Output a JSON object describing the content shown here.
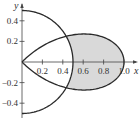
{
  "chart_data": {
    "type": "polar-region",
    "title": "",
    "xlabel": "x",
    "ylabel": "y",
    "xlim": [
      0,
      1.1
    ],
    "ylim": [
      -0.55,
      0.55
    ],
    "x_ticks": [
      0.2,
      0.4,
      0.6,
      0.8,
      1.0
    ],
    "x_tick_labels": [
      "0.2",
      "0.4",
      "0.6",
      "0.8",
      "1.0"
    ],
    "y_ticks": [
      0.4,
      0.2,
      -0.2,
      -0.4
    ],
    "y_tick_labels": [
      "0.4",
      "0.2",
      "−0.2",
      "−0.4"
    ],
    "grid": false,
    "curves": [
      {
        "name": "circle",
        "equation": "r = 1/2",
        "theta_range_deg": [
          -90,
          90
        ]
      },
      {
        "name": "rose-petal",
        "equation": "r = cos 2θ",
        "theta_range_deg": [
          -45,
          45
        ]
      }
    ],
    "shaded_region": {
      "description": "inside r = cos 2θ and outside r = 1/2",
      "theta_range_deg": [
        -30,
        30
      ],
      "fill": "#d9d9d9"
    },
    "intersection_points": [
      [
        0.433,
        0.25
      ],
      [
        0.433,
        -0.25
      ]
    ],
    "colors": {
      "curve": "#2a2a2a",
      "axis": "#444444",
      "fill": "#d9d9d9"
    }
  }
}
